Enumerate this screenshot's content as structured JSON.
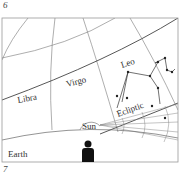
{
  "page_numbers": {
    "top": "6",
    "bottom": "7"
  },
  "diagram": {
    "labels": {
      "libra": "Libra",
      "virgo": "Virgo",
      "leo": "Leo",
      "ecliptic": "Ecliptic",
      "sun": "Sun",
      "earth": "Earth"
    },
    "icons": {
      "observer": "person-silhouette-icon",
      "sun": "sun-dome-icon"
    },
    "colors": {
      "line": "#555555",
      "frame": "#888888",
      "silhouette": "#111111"
    }
  }
}
